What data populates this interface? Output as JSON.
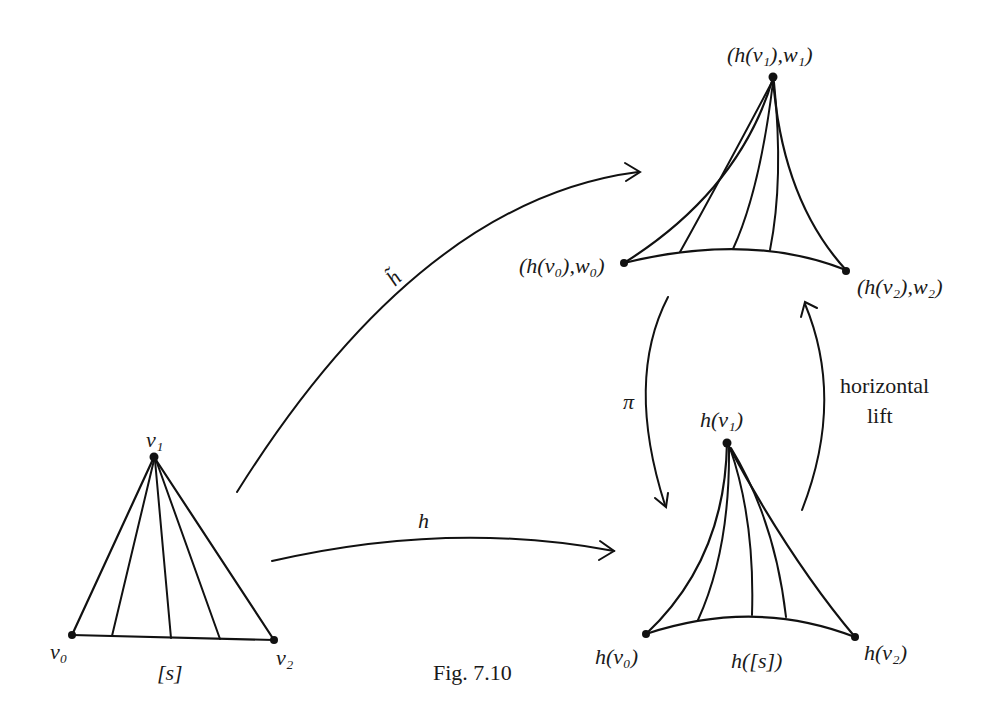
{
  "figure": {
    "caption": "Fig. 7.10",
    "source_simplex": {
      "vertices": {
        "v0": "v₀",
        "v1": "v₁",
        "v2": "v₂"
      },
      "name": "[s]"
    },
    "lifted_simplex": {
      "vertices": {
        "v0": "(h(v₀),w₀)",
        "v1": "(h(v₁),w₁)",
        "v2": "(h(v₂),w₂)"
      }
    },
    "image_simplex": {
      "vertices": {
        "v0": "h(v₀)",
        "v1": "h(v₁)",
        "v2": "h(v₂)"
      },
      "name": "h([s])"
    },
    "arrows": {
      "h_tilde": "h̃",
      "h": "h",
      "pi": "π",
      "horizontal_lift_line1": "horizontal",
      "horizontal_lift_line2": "lift"
    },
    "stroke_color": "#111111",
    "background": "#ffffff"
  }
}
